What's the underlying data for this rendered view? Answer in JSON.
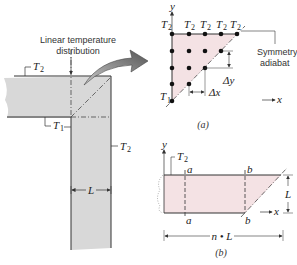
{
  "figure": {
    "left_view": {
      "annotation": [
        "Linear temperature",
        "distribution"
      ],
      "labels": {
        "top_temp": "T",
        "top_temp_sub": "2",
        "corner_temp": "T",
        "corner_temp_sub": "1",
        "right_temp": "T",
        "right_temp_sub": "2",
        "width": "L"
      },
      "fill_color": "#d8d8d8"
    },
    "part_a": {
      "caption": "(a)",
      "axis_x": "x",
      "axis_y": "y",
      "top_labels": [
        "T",
        "T",
        "T",
        "T",
        "T"
      ],
      "top_label_sub": "2",
      "origin_label": "T",
      "origin_label_sub": "1",
      "symmetry_label": [
        "Symmetry",
        "adiabat"
      ],
      "dx_label": "Δx",
      "dy_label": "Δy",
      "fill_color": "#f4e2e4"
    },
    "part_b": {
      "caption": "(b)",
      "axis_x": "x",
      "axis_y": "y",
      "top_temp": "T",
      "top_temp_sub": "2",
      "section_a_top": "a",
      "section_a_bottom": "a",
      "section_b_top": "b",
      "section_b_bottom": "b",
      "height_label": "L",
      "length_label": "n • L",
      "fill_color": "#f4e2e4"
    }
  }
}
